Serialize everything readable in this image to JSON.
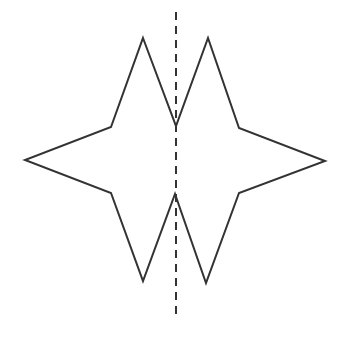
{
  "figure": {
    "width": 345,
    "height": 339,
    "background": "#ffffff",
    "stroke_color": "#333333",
    "shape": {
      "name": "four-pointed star with split top and bottom points",
      "points": "143,38 176,126 208,38 239,128 325,161 239,193 206,283 175,194 143,281 111,193 25,160 111,127",
      "stroke_width": 2
    },
    "axis": {
      "name": "line of symmetry",
      "x": 176,
      "y1": 12,
      "y2": 320,
      "dasharray": "8,6",
      "stroke_width": 2
    }
  }
}
